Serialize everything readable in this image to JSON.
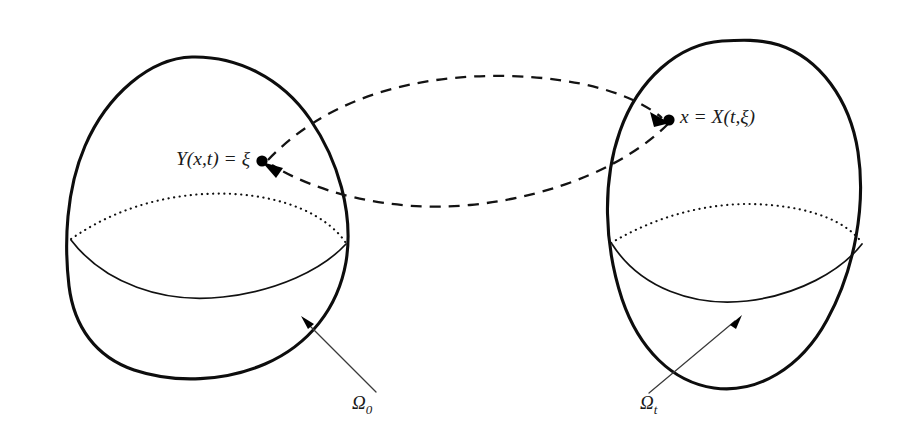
{
  "figure": {
    "type": "diagram",
    "background_color": "#ffffff",
    "stroke_color": "#0d0d0d",
    "accent_color": "#000000",
    "width": 912,
    "height": 440
  },
  "domains": [
    {
      "id": "reference",
      "label": "Ω",
      "subscript": "0",
      "label_full": "Ω₀",
      "role": "reference-configuration",
      "center": [
        215,
        213
      ],
      "leader_arrow": {
        "tail": [
          376,
          392
        ],
        "tip": [
          302,
          318
        ]
      },
      "label_position": [
        352,
        402
      ]
    },
    {
      "id": "current",
      "label": "Ω",
      "subscript": "t",
      "label_full": "Ωt",
      "role": "current-configuration",
      "center": [
        738,
        213
      ],
      "leader_arrow": {
        "tail": [
          649,
          393
        ],
        "tip": [
          741,
          316
        ]
      },
      "label_position": [
        640,
        402
      ]
    }
  ],
  "points": [
    {
      "id": "xi-point",
      "label": "Y(x,t) = ξ",
      "label_parts": {
        "function": "Y",
        "args": "(x, t)",
        "equals": "=",
        "value": "ξ"
      },
      "dot_position": [
        263,
        162
      ],
      "label_anchor": "end",
      "label_position": [
        254,
        161
      ],
      "domain": "reference"
    },
    {
      "id": "x-point",
      "label": "x = X(t,ξ)",
      "label_parts": {
        "variable": "x",
        "equals": "=",
        "function": "X",
        "args": "(t, ξ)"
      },
      "dot_position": [
        668,
        120
      ],
      "label_anchor": "start",
      "label_position": [
        679,
        119
      ],
      "domain": "current"
    }
  ],
  "maps": [
    {
      "id": "forward-map",
      "name": "X(t,ξ)",
      "from": "xi-point",
      "to": "x-point",
      "style": "dashed",
      "direction": "left-to-right",
      "arrowhead_at": [
        663,
        119
      ]
    },
    {
      "id": "inverse-map",
      "name": "Y(x,t)",
      "from": "x-point",
      "to": "xi-point",
      "style": "dashed",
      "direction": "right-to-left",
      "arrowhead_at": [
        268,
        164
      ]
    }
  ],
  "equators": [
    {
      "id": "reference-equator",
      "back": "dotted",
      "front": "solid"
    },
    {
      "id": "current-equator",
      "back": "dotted",
      "front": "solid"
    }
  ]
}
